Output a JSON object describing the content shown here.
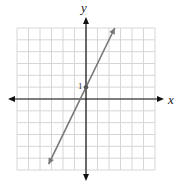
{
  "chart_data": {
    "type": "line",
    "title": "",
    "xlabel": "x",
    "ylabel": "y",
    "xlim": [
      -6,
      6
    ],
    "ylim": [
      -6,
      6
    ],
    "grid": true,
    "tick_labels": [
      {
        "axis": "y",
        "value": 1,
        "label": "1"
      }
    ],
    "series": [
      {
        "name": "line",
        "equation": "y = 2x + 1",
        "slope": 2,
        "intercept": 1,
        "x": [
          -3.25,
          2.5
        ],
        "y": [
          -5.5,
          6.0
        ],
        "marked_point": [
          0,
          1
        ],
        "arrows": "both-ends"
      }
    ],
    "colors": {
      "grid": "#d6d6d6",
      "axes": "#111111",
      "line": "#777777"
    }
  },
  "labels": {
    "x_axis": "x",
    "y_axis": "y",
    "y_tick_1": "1"
  }
}
